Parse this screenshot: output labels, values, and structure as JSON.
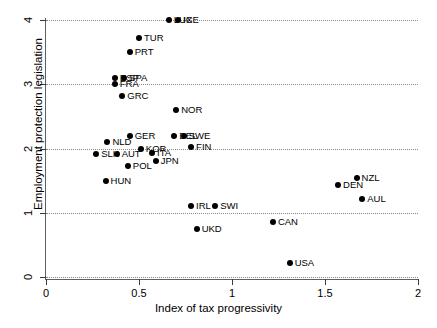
{
  "chart_data": {
    "type": "scatter",
    "title": "",
    "xlabel": "Index of tax progressivity",
    "ylabel": "Employment protection legislation",
    "xlim": [
      0,
      2
    ],
    "ylim": [
      0,
      4
    ],
    "xticks": [
      "0",
      "0.5",
      "1",
      "1.5",
      "2"
    ],
    "xtick_values": [
      0,
      0.5,
      1,
      1.5,
      2
    ],
    "yticks": [
      "0",
      "1",
      "2",
      "3",
      "4"
    ],
    "ytick_values": [
      0,
      1,
      2,
      3,
      4
    ],
    "grid": "horizontal-dotted",
    "legend": "none",
    "marker": "filled-circle-black",
    "points": [
      {
        "label": "LUX",
        "x": 0.66,
        "y": 4.0,
        "label_dx": 5,
        "label_dy": 0
      },
      {
        "label": "ICE",
        "x": 0.71,
        "y": 4.0,
        "label_dx": 5,
        "label_dy": 0
      },
      {
        "label": "TUR",
        "x": 0.5,
        "y": 3.72,
        "label_dx": 5,
        "label_dy": 0
      },
      {
        "label": "PRT",
        "x": 0.45,
        "y": 3.5,
        "label_dx": 5,
        "label_dy": 0
      },
      {
        "label": "ESP",
        "x": 0.37,
        "y": 3.1,
        "label_dx": 5,
        "label_dy": 0
      },
      {
        "label": "SPA",
        "x": 0.42,
        "y": 3.1,
        "label_dx": 5,
        "label_dy": 0
      },
      {
        "label": "FRA",
        "x": 0.37,
        "y": 3.0,
        "label_dx": 5,
        "label_dy": 0
      },
      {
        "label": "GRC",
        "x": 0.41,
        "y": 2.82,
        "label_dx": 5,
        "label_dy": 0
      },
      {
        "label": "NOR",
        "x": 0.7,
        "y": 2.6,
        "label_dx": 5,
        "label_dy": 0
      },
      {
        "label": "GER",
        "x": 0.45,
        "y": 2.19,
        "label_dx": 5,
        "label_dy": 0
      },
      {
        "label": "BEL",
        "x": 0.69,
        "y": 2.19,
        "label_dx": 5,
        "label_dy": 0
      },
      {
        "label": "SWE",
        "x": 0.74,
        "y": 2.19,
        "label_dx": 5,
        "label_dy": 0
      },
      {
        "label": "NLD",
        "x": 0.33,
        "y": 2.1,
        "label_dx": 5,
        "label_dy": 0
      },
      {
        "label": "KOR",
        "x": 0.51,
        "y": 2.0,
        "label_dx": 5,
        "label_dy": 0
      },
      {
        "label": "FIN",
        "x": 0.78,
        "y": 2.02,
        "label_dx": 5,
        "label_dy": 0
      },
      {
        "label": "SLK",
        "x": 0.27,
        "y": 1.92,
        "label_dx": 5,
        "label_dy": 0
      },
      {
        "label": "AUT",
        "x": 0.38,
        "y": 1.92,
        "label_dx": 5,
        "label_dy": 0
      },
      {
        "label": "ITA",
        "x": 0.57,
        "y": 1.93,
        "label_dx": 5,
        "label_dy": 0
      },
      {
        "label": "JPN",
        "x": 0.59,
        "y": 1.81,
        "label_dx": 5,
        "label_dy": 0
      },
      {
        "label": "POL",
        "x": 0.44,
        "y": 1.72,
        "label_dx": 5,
        "label_dy": 0
      },
      {
        "label": "HUN",
        "x": 0.32,
        "y": 1.5,
        "label_dx": 5,
        "label_dy": 0
      },
      {
        "label": "NZL",
        "x": 1.67,
        "y": 1.54,
        "label_dx": 5,
        "label_dy": 0
      },
      {
        "label": "DEN",
        "x": 1.57,
        "y": 1.43,
        "label_dx": 5,
        "label_dy": 0
      },
      {
        "label": "AUL",
        "x": 1.7,
        "y": 1.21,
        "label_dx": 5,
        "label_dy": 0
      },
      {
        "label": "IRL",
        "x": 0.78,
        "y": 1.11,
        "label_dx": 5,
        "label_dy": 0
      },
      {
        "label": "SWI",
        "x": 0.91,
        "y": 1.11,
        "label_dx": 5,
        "label_dy": 0
      },
      {
        "label": "CAN",
        "x": 1.22,
        "y": 0.85,
        "label_dx": 5,
        "label_dy": 0
      },
      {
        "label": "UKD",
        "x": 0.81,
        "y": 0.74,
        "label_dx": 5,
        "label_dy": 0
      },
      {
        "label": "USA",
        "x": 1.31,
        "y": 0.22,
        "label_dx": 5,
        "label_dy": 0
      }
    ]
  },
  "colors": {
    "marker": "#000000",
    "grid": "#8a8a8a",
    "axis": "#5f5f5f",
    "text": "#000000",
    "background": "#ffffff"
  }
}
